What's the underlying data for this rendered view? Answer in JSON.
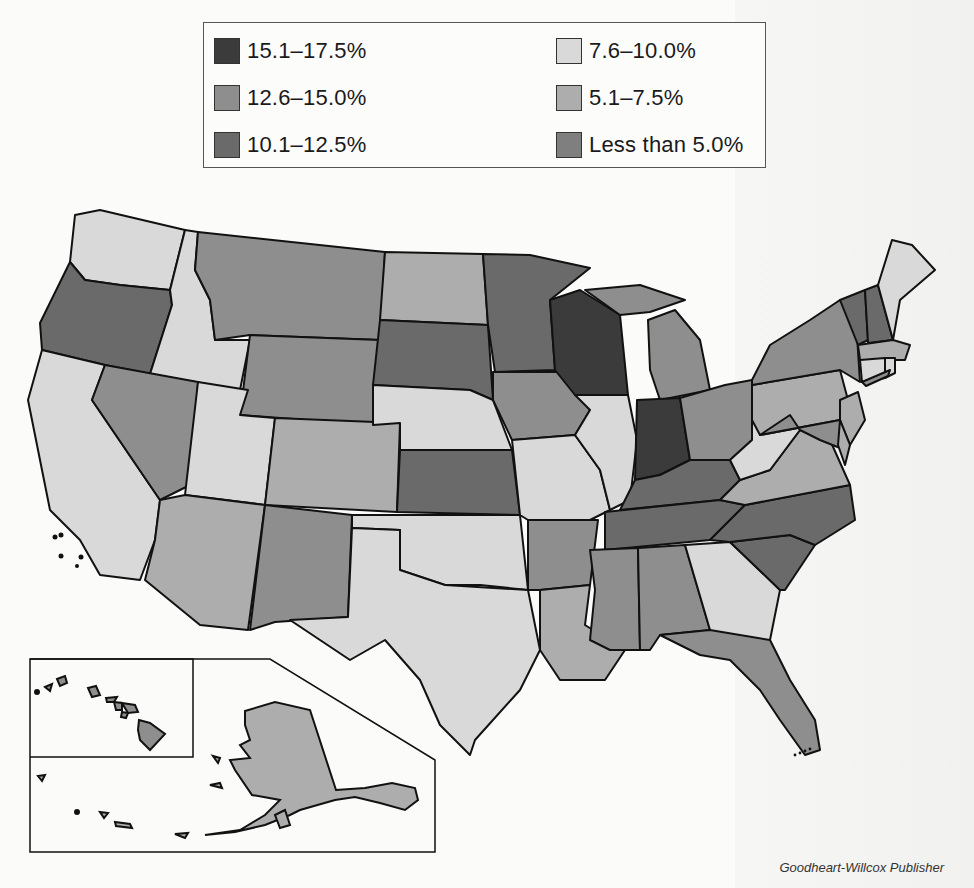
{
  "legend": {
    "items": [
      {
        "label": "15.1–17.5%",
        "color": "#3b3b3b"
      },
      {
        "label": "12.6–15.0%",
        "color": "#8e8e8e"
      },
      {
        "label": "10.1–12.5%",
        "color": "#6a6a6a"
      },
      {
        "label": "7.6–10.0%",
        "color": "#d9d9d9"
      },
      {
        "label": "5.1–7.5%",
        "color": "#adadad"
      },
      {
        "label": "Less than 5.0%",
        "color": "#7f7f7f"
      }
    ]
  },
  "credit": "Goodheart-Willcox Publisher",
  "map": {
    "title": "United States choropleth map by percentage range",
    "insets": [
      "Alaska",
      "Hawaii"
    ],
    "states": {
      "WA": "7.6–10.0%",
      "OR": "10.1–12.5%",
      "CA": "7.6–10.0%",
      "ID": "7.6–10.0%",
      "NV": "12.6–15.0%",
      "MT": "12.6–15.0%",
      "WY": "12.6–15.0%",
      "UT": "7.6–10.0%",
      "AZ": "5.1–7.5%",
      "CO": "5.1–7.5%",
      "NM": "12.6–15.0%",
      "ND": "5.1–7.5%",
      "SD": "10.1–12.5%",
      "NE": "7.6–10.0%",
      "KS": "10.1–12.5%",
      "OK": "7.6–10.0%",
      "TX": "7.6–10.0%",
      "MN": "10.1–12.5%",
      "IA": "12.6–15.0%",
      "MO": "7.6–10.0%",
      "AR": "12.6–15.0%",
      "LA": "5.1–7.5%",
      "WI": "15.1–17.5%",
      "IL": "7.6–10.0%",
      "MI": "12.6–15.0%",
      "IN": "15.1–17.5%",
      "OH": "12.6–15.0%",
      "KY": "10.1–12.5%",
      "TN": "10.1–12.5%",
      "MS": "12.6–15.0%",
      "AL": "12.6–15.0%",
      "GA": "7.6–10.0%",
      "FL": "12.6–15.0%",
      "SC": "10.1–12.5%",
      "NC": "10.1–12.5%",
      "VA": "5.1–7.5%",
      "WV": "7.6–10.0%",
      "PA": "5.1–7.5%",
      "NY": "12.6–15.0%",
      "VT": "10.1–12.5%",
      "NH": "10.1–12.5%",
      "ME": "7.6–10.0%",
      "MA": "5.1–7.5%",
      "CT": "7.6–10.0%",
      "RI": "7.6–10.0%",
      "NJ": "5.1–7.5%",
      "DE": "5.1–7.5%",
      "MD": "12.6–15.0%",
      "AK": "5.1–7.5%",
      "HI": "12.6–15.0%"
    }
  }
}
